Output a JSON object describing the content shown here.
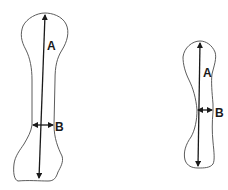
{
  "diagram": {
    "type": "bone-measurement-comparison",
    "figures": [
      {
        "id": "large-bone",
        "length_label": "A",
        "width_label": "B"
      },
      {
        "id": "small-bone",
        "length_label": "A",
        "width_label": "B"
      }
    ],
    "colors": {
      "outline": "#4a4a4a",
      "arrow": "#1a1a1a",
      "background": "#ffffff"
    }
  }
}
